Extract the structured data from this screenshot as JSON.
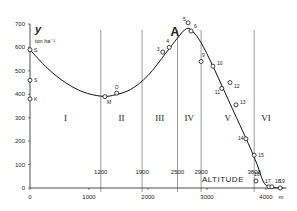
{
  "chart_data": {
    "type": "scatter",
    "title": "A",
    "xlabel": "ALTITUDE",
    "xunit": "m",
    "ylabel": "y",
    "yunit": "ton ha⁻¹",
    "xlim": [
      0,
      4300
    ],
    "ylim": [
      0,
      700
    ],
    "xticks": [
      0,
      1000,
      2000,
      3000,
      4000
    ],
    "yticks": [
      0,
      100,
      200,
      300,
      400,
      500,
      600,
      700
    ],
    "grid": false,
    "zones": [
      {
        "label": "I",
        "from": 0,
        "to": 1200
      },
      {
        "label": "II",
        "from": 1200,
        "to": 1900
      },
      {
        "label": "III",
        "from": 1900,
        "to": 2500
      },
      {
        "label": "IV",
        "from": 2500,
        "to": 2900
      },
      {
        "label": "V",
        "from": 2900,
        "to": 3800
      },
      {
        "label": "VI",
        "from": 3800,
        "to": 4300
      }
    ],
    "boundary_labels": [
      "1200",
      "1900",
      "2500",
      "2900",
      "3800"
    ],
    "points": [
      {
        "label": "S",
        "x": 0,
        "y": 590
      },
      {
        "label": "S",
        "x": 0,
        "y": 460
      },
      {
        "label": "K",
        "x": 0,
        "y": 380
      },
      {
        "label": "M",
        "x": 1270,
        "y": 390
      },
      {
        "label": "O",
        "x": 1470,
        "y": 405
      },
      {
        "label": "3",
        "x": 2250,
        "y": 580
      },
      {
        "label": "4",
        "x": 2360,
        "y": 600
      },
      {
        "label": "5",
        "x": 2680,
        "y": 705
      },
      {
        "label": "6",
        "x": 2730,
        "y": 670
      },
      {
        "label": "9",
        "x": 2900,
        "y": 540
      },
      {
        "label": "10",
        "x": 3100,
        "y": 520
      },
      {
        "label": "11",
        "x": 3250,
        "y": 425
      },
      {
        "label": "12",
        "x": 3390,
        "y": 450
      },
      {
        "label": "13",
        "x": 3490,
        "y": 355
      },
      {
        "label": "14",
        "x": 3660,
        "y": 210
      },
      {
        "label": "15",
        "x": 3800,
        "y": 140
      },
      {
        "label": "16",
        "x": 3830,
        "y": 30
      },
      {
        "label": "17",
        "x": 4050,
        "y": 5
      },
      {
        "label": "18",
        "x": 4100,
        "y": 5
      },
      {
        "label": "19",
        "x": 4240,
        "y": 0
      }
    ],
    "fit_curve": [
      [
        0,
        590
      ],
      [
        300,
        510
      ],
      [
        600,
        450
      ],
      [
        900,
        410
      ],
      [
        1200,
        392
      ],
      [
        1400,
        395
      ],
      [
        1700,
        420
      ],
      [
        2000,
        480
      ],
      [
        2300,
        575
      ],
      [
        2500,
        640
      ],
      [
        2650,
        680
      ],
      [
        2750,
        670
      ],
      [
        2900,
        620
      ],
      [
        3100,
        520
      ],
      [
        3300,
        410
      ],
      [
        3500,
        300
      ],
      [
        3700,
        190
      ],
      [
        3850,
        100
      ],
      [
        3950,
        30
      ],
      [
        4050,
        5
      ],
      [
        4300,
        0
      ]
    ]
  }
}
